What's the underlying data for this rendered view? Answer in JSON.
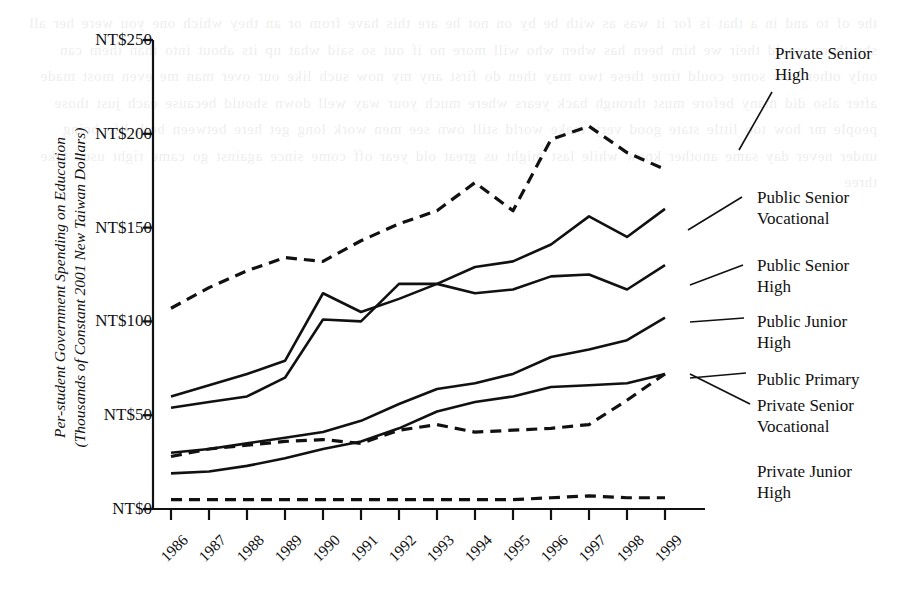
{
  "chart_data": {
    "type": "line",
    "title": "",
    "xlabel": "",
    "ylabel": "Per-student Government Spending on Education\n(Thousands of Constant 2001 New Taiwan Dollars)",
    "categories": [
      1986,
      1987,
      1988,
      1989,
      1990,
      1991,
      1992,
      1993,
      1994,
      1995,
      1996,
      1997,
      1998,
      1999
    ],
    "x": [
      "1986",
      "1987",
      "1988",
      "1989",
      "1990",
      "1991",
      "1992",
      "1993",
      "1994",
      "1995",
      "1996",
      "1997",
      "1998",
      "1999"
    ],
    "ylim": [
      0,
      250
    ],
    "yticks": [
      0,
      50,
      100,
      150,
      200,
      250
    ],
    "ytick_labels": [
      "NT$0",
      "NT$50",
      "NT$100",
      "NT$150",
      "NT$200",
      "NT$250"
    ],
    "grid": false,
    "legend_position": "right-inline-labels",
    "series": [
      {
        "name": "Private Senior High",
        "style": "dashed",
        "values": [
          107,
          118,
          127,
          134,
          132,
          143,
          152,
          159,
          174,
          159,
          197,
          204,
          190,
          181
        ]
      },
      {
        "name": "Public Senior Vocational",
        "style": "solid",
        "values": [
          60,
          66,
          72,
          79,
          115,
          105,
          112,
          120,
          129,
          132,
          141,
          156,
          145,
          160
        ]
      },
      {
        "name": "Public Senior High",
        "style": "solid",
        "values": [
          54,
          57,
          60,
          70,
          101,
          100,
          120,
          120,
          115,
          117,
          124,
          125,
          117,
          130
        ]
      },
      {
        "name": "Public Junior High",
        "style": "solid",
        "values": [
          30,
          32,
          35,
          38,
          41,
          47,
          56,
          64,
          67,
          72,
          81,
          85,
          90,
          102
        ]
      },
      {
        "name": "Public Primary",
        "style": "solid",
        "values": [
          19,
          20,
          23,
          27,
          32,
          36,
          43,
          52,
          57,
          60,
          65,
          66,
          67,
          72
        ]
      },
      {
        "name": "Private Senior Vocational",
        "style": "dashed",
        "values": [
          28,
          32,
          34,
          36,
          37,
          35,
          42,
          45,
          41,
          42,
          43,
          45,
          58,
          72
        ]
      },
      {
        "name": "Private Junior High",
        "style": "dashed",
        "values": [
          5,
          5,
          5,
          5,
          5,
          5,
          5,
          5,
          5,
          5,
          6,
          7,
          6,
          6
        ]
      }
    ]
  },
  "labels": {
    "private_senior_high": "Private Senior\nHigh",
    "public_senior_vocational": "Public Senior\nVocational",
    "public_senior_high": "Public Senior\nHigh",
    "public_junior_high": "Public Junior\nHigh",
    "public_primary": "Public Primary",
    "private_senior_vocational": "Private Senior\nVocational",
    "private_junior_high": "Private Junior\nHigh"
  },
  "axis": {
    "y_title": "Per-student Government Spending on Education\n(Thousands of Constant 2001 New Taiwan Dollars)"
  },
  "colors": {
    "ink": "#111111",
    "paper": "#ffffff"
  },
  "bleed_text": "the of to and in a that is for it was as with be by on not he are this have from or an they which one you were her all she there would their we him been has when who will more no if out so said what up its about into than them can only other new some could time these two may then do first any my now such like our over man me even most made after also did many before must through back years where much your way well down should because each just those people mr how too little state good very make world still own see men work long get here between both life being under never day same another know while last might us great old year off come since against go came right used take three"
}
